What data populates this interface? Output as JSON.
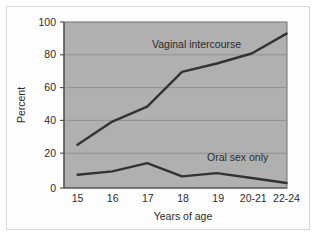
{
  "chart_data": {
    "type": "line",
    "title": "",
    "xlabel": "Years of age",
    "ylabel": "Percent",
    "categories": [
      "15",
      "16",
      "17",
      "18",
      "19",
      "20-21",
      "22-24"
    ],
    "ylim": [
      0,
      100
    ],
    "yticks": [
      "0",
      "20",
      "40",
      "60",
      "80",
      "100"
    ],
    "grid": true,
    "legend_position": "inline-annotation",
    "plot_background": "#b0b0b0",
    "line_color": "#333333",
    "series": [
      {
        "name": "Vaginal intercourse",
        "values": [
          26,
          40,
          49,
          70,
          75,
          81,
          93
        ]
      },
      {
        "name": "Oral sex only",
        "values": [
          8,
          10,
          15,
          7,
          9,
          6,
          3
        ]
      }
    ],
    "annotations": [
      {
        "text": "Vaginal intercourse",
        "series": "Vaginal intercourse"
      },
      {
        "text": "Oral sex only",
        "series": "Oral sex only"
      }
    ]
  },
  "axes": {
    "y_title": "Percent",
    "x_title": "Years of age",
    "y_ticks": [
      "100",
      "80",
      "60",
      "40",
      "20",
      "0"
    ],
    "x_ticks": [
      "15",
      "16",
      "17",
      "18",
      "19",
      "20-21",
      "22-24"
    ]
  },
  "labels": {
    "upper_series": "Vaginal intercourse",
    "lower_series": "Oral sex only"
  }
}
